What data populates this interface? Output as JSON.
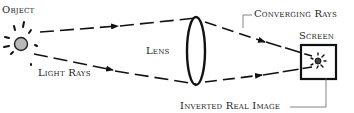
{
  "diagram": {
    "type": "optics-lens-image-formation",
    "labels": {
      "object": "Object",
      "light_rays": "Light Rays",
      "lens": "Lens",
      "converging_rays": "Converging Rays",
      "screen": "Screen",
      "inverted_real_image": "Inverted Real Image"
    },
    "elements": [
      {
        "id": "object",
        "kind": "light-source",
        "shape": "sun-with-rays",
        "fill": "#b8b8b8"
      },
      {
        "id": "light-rays",
        "kind": "dashed-arrows",
        "count": 2,
        "direction": "object-to-lens"
      },
      {
        "id": "lens",
        "kind": "convex-lens",
        "shape": "ellipse"
      },
      {
        "id": "converging-rays",
        "kind": "dashed-arrows",
        "count": 2,
        "direction": "lens-to-screen"
      },
      {
        "id": "screen",
        "kind": "square-screen"
      },
      {
        "id": "image",
        "kind": "inverted-real-image",
        "shape": "small-sun",
        "location": "on-screen"
      }
    ],
    "colors": {
      "ink": "#111111",
      "object_fill": "#b8b8b8",
      "leader_line": "#666666",
      "text": "#222222"
    }
  }
}
